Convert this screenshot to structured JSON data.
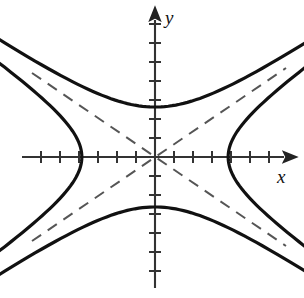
{
  "figure": {
    "kind": "conjugate-hyperbola-pair-graph",
    "background_color": "#ffffff",
    "ink_color": "#111111",
    "axis_color": "#333333",
    "curve_color": "#111111",
    "asymptote_color": "#555555"
  },
  "axes": {
    "x_label": "x",
    "y_label": "y",
    "origin_px": {
      "x": 155,
      "y": 157
    },
    "x_axis_start_px": 22,
    "x_axis_end_px": 290,
    "y_axis_top_px": 14,
    "y_axis_bottom_px": 288,
    "tick_spacing_px": 19,
    "tick_half_length_px": 6,
    "x_ticks_left_count": 6,
    "x_ticks_right_count": 6,
    "y_ticks_up_count": 7,
    "y_ticks_down_count": 6,
    "arrowheads": [
      "x-positive",
      "y-positive"
    ]
  },
  "chart_data": {
    "type": "line",
    "title": "",
    "xlabel": "x",
    "ylabel": "y",
    "grid": false,
    "legend": "none",
    "xlim": [
      -7,
      7
    ],
    "ylim": [
      -7,
      7
    ],
    "units_per_tick": 1,
    "hyperbolas": [
      {
        "name": "horizontal-hyperbola",
        "equation": "x^2/a^2 - y^2/b^2 = 1",
        "transverse_axis": "horizontal",
        "semi_axis_a_units": 3.85,
        "semi_axis_b_units": 2.63,
        "vertices_units": [
          [
            -3.85,
            0
          ],
          [
            3.85,
            0
          ]
        ],
        "vertices_px": [
          [
            82,
            157
          ],
          [
            228,
            157
          ]
        ],
        "opens": [
          "left",
          "right"
        ],
        "stroke_width_px": 3
      },
      {
        "name": "vertical-hyperbola",
        "equation": "y^2/b^2 - x^2/a^2 = 1",
        "transverse_axis": "vertical",
        "semi_axis_a_units": 3.85,
        "semi_axis_b_units": 2.63,
        "vertices_units": [
          [
            0,
            2.63
          ],
          [
            0,
            -2.63
          ]
        ],
        "vertices_px": [
          [
            155,
            107
          ],
          [
            155,
            207
          ]
        ],
        "opens": [
          "up",
          "down"
        ],
        "stroke_width_px": 3
      }
    ],
    "asymptotes": [
      {
        "name": "asymptote-positive-slope",
        "equation": "y = (b/a) x",
        "slope": 0.683,
        "dashed": true,
        "endpoints_px": [
          [
            32,
            241
          ],
          [
            286,
            68
          ]
        ]
      },
      {
        "name": "asymptote-negative-slope",
        "equation": "y = -(b/a) x",
        "slope": -0.683,
        "dashed": true,
        "endpoints_px": [
          [
            32,
            73
          ],
          [
            286,
            246
          ]
        ]
      }
    ]
  }
}
